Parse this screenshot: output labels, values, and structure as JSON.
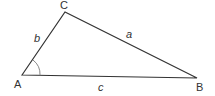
{
  "diagram": {
    "type": "triangle",
    "vertices": {
      "A": {
        "label": "A",
        "x": 22,
        "y": 75
      },
      "B": {
        "label": "B",
        "x": 197,
        "y": 78
      },
      "C": {
        "label": "C",
        "x": 65,
        "y": 12
      }
    },
    "sides": {
      "a": {
        "label": "a",
        "from": "B",
        "to": "C"
      },
      "b": {
        "label": "b",
        "from": "A",
        "to": "C"
      },
      "c": {
        "label": "c",
        "from": "A",
        "to": "B"
      }
    },
    "angle_marker": {
      "at": "A"
    },
    "colors": {
      "stroke": "#333333",
      "angle": "#888888"
    }
  }
}
